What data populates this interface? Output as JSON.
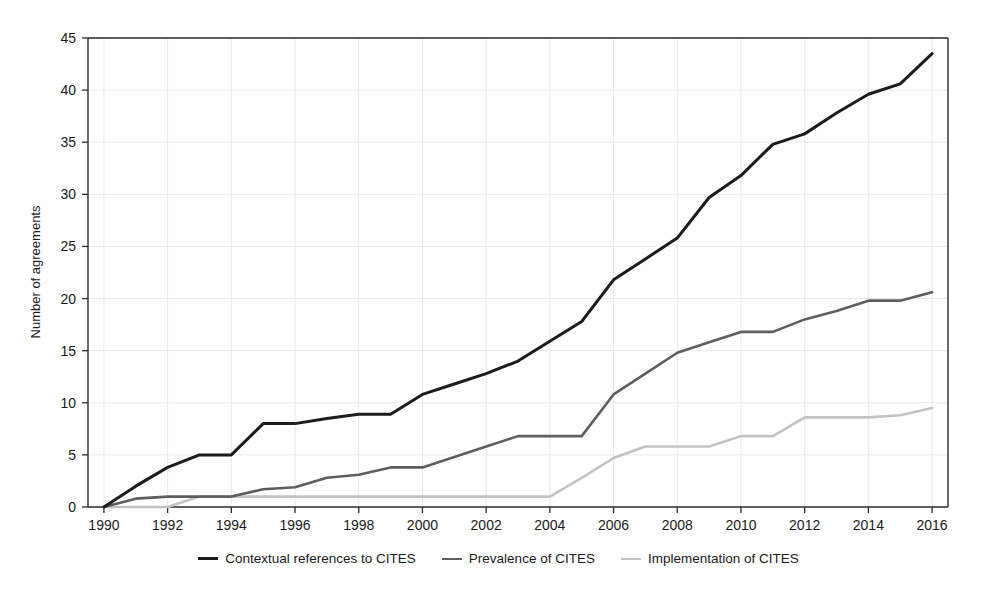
{
  "chart_data": {
    "type": "line",
    "title": "",
    "xlabel": "",
    "ylabel": "Number of agreements",
    "xlim": [
      1989.5,
      2016.5
    ],
    "ylim": [
      0,
      45
    ],
    "ytick_values": [
      0,
      5,
      10,
      15,
      20,
      25,
      30,
      35,
      40,
      45
    ],
    "ytick_labels": [
      "0",
      "5",
      "10",
      "15",
      "20",
      "25",
      "30",
      "35",
      "40",
      "45"
    ],
    "xtick_values": [
      1990,
      1992,
      1994,
      1996,
      1998,
      2000,
      2002,
      2004,
      2006,
      2008,
      2010,
      2012,
      2014,
      2016
    ],
    "xtick_labels": [
      "1990",
      "1992",
      "1994",
      "1996",
      "1998",
      "2000",
      "2002",
      "2004",
      "2006",
      "2008",
      "2010",
      "2012",
      "2014",
      "2016"
    ],
    "grid": true,
    "legend_position": "bottom",
    "x": [
      1990,
      1991,
      1992,
      1993,
      1994,
      1995,
      1996,
      1997,
      1998,
      1999,
      2000,
      2001,
      2002,
      2003,
      2004,
      2005,
      2006,
      2007,
      2008,
      2009,
      2010,
      2011,
      2012,
      2013,
      2014,
      2015,
      2016
    ],
    "series": [
      {
        "name": "Contextual references to CITES",
        "color": "#1c1c1c",
        "width": 3.0,
        "values": [
          0,
          2,
          3.8,
          5,
          5,
          8,
          8,
          8.5,
          8.9,
          8.9,
          10.8,
          11.8,
          12.8,
          14,
          15.9,
          17.8,
          21.8,
          23.8,
          25.8,
          29.7,
          31.8,
          34.8,
          35.8,
          37.8,
          39.6,
          40.6,
          43.5
        ]
      },
      {
        "name": "Prevalence of CITES",
        "color": "#5e5e5e",
        "width": 2.6,
        "values": [
          0,
          0.8,
          1,
          1,
          1,
          1.7,
          1.9,
          2.8,
          3.1,
          3.8,
          3.8,
          4.8,
          5.8,
          6.8,
          6.8,
          6.8,
          10.8,
          12.8,
          14.8,
          15.8,
          16.8,
          16.8,
          18.0,
          18.8,
          19.8,
          19.8,
          20.6
        ]
      },
      {
        "name": "Implementation of CITES",
        "color": "#c3c3c3",
        "width": 2.6,
        "values": [
          0,
          0,
          0,
          1,
          1,
          1,
          1,
          1,
          1,
          1,
          1,
          1,
          1,
          1,
          1,
          2.8,
          4.7,
          5.8,
          5.8,
          5.8,
          6.8,
          6.8,
          8.6,
          8.6,
          8.6,
          8.8,
          9.5
        ]
      }
    ]
  },
  "legend": {
    "items": [
      {
        "label": "Contextual references to CITES",
        "color": "#1c1c1c",
        "thickness": "3px"
      },
      {
        "label": "Prevalence of CITES",
        "color": "#5e5e5e",
        "thickness": "2.5px"
      },
      {
        "label": "Implementation of CITES",
        "color": "#c3c3c3",
        "thickness": "2.5px"
      }
    ]
  }
}
